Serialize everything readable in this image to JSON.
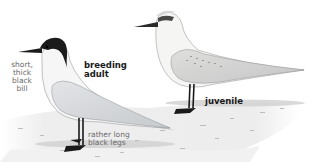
{
  "illustration": {
    "subject": "Gull-billed Tern",
    "birds": [
      {
        "id": "breeding-adult",
        "label_lines": [
          "breeding",
          "adult"
        ],
        "annotations": {
          "bill": [
            "short,",
            "thick",
            "black",
            "bill"
          ],
          "legs": [
            "rather long",
            "black legs"
          ]
        }
      },
      {
        "id": "juvenile",
        "label_lines": [
          "juvenile"
        ]
      }
    ]
  },
  "colors": {
    "background": "#ffffff",
    "sand": "#ececec",
    "shadow": "#c9c9c9",
    "cap": "#1b1b1b",
    "body_white": "#f6f6f6",
    "wing_grey": "#d4d7da",
    "legs": "#1a1a1a",
    "label_dark": "#1a1a1a",
    "label_light": "#6a6a6a"
  }
}
